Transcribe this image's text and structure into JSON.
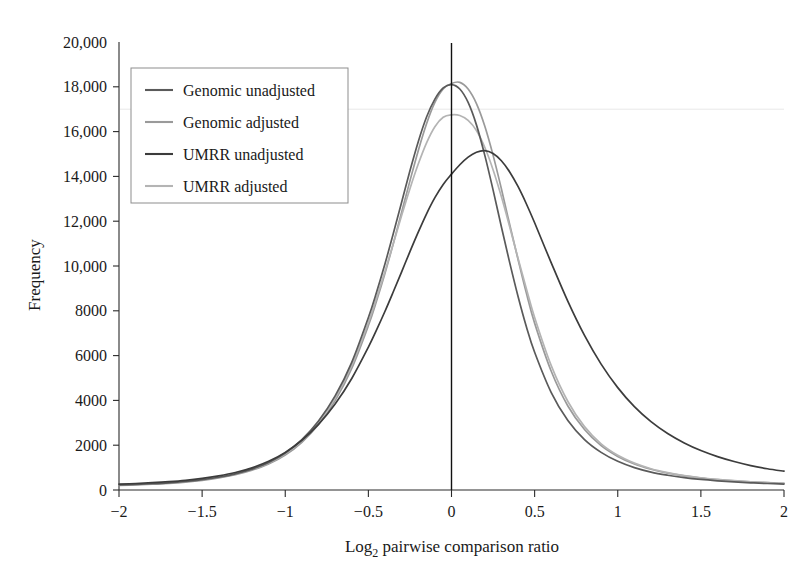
{
  "chart_data": {
    "type": "line",
    "title": "",
    "xlabel": "Log2 pairwise comparison ratio",
    "xlabel_base": "Log",
    "xlabel_sub": "2",
    "xlabel_rest": " pairwise comparison ratio",
    "ylabel": "Frequency",
    "xlim": [
      -2,
      2
    ],
    "ylim": [
      0,
      20000
    ],
    "grid": false,
    "legend_position": "top-left",
    "xticks": [
      -2,
      -1.5,
      -1,
      -0.5,
      0,
      0.5,
      1,
      1.5,
      2
    ],
    "xtick_labels": [
      "−2",
      "−1.5",
      "−1",
      "−0.5",
      "0",
      "0.5",
      "1",
      "1.5",
      "2"
    ],
    "yticks": [
      0,
      2000,
      4000,
      6000,
      8000,
      10000,
      12000,
      14000,
      16000,
      18000,
      20000
    ],
    "ytick_labels": [
      "0",
      "2000",
      "4000",
      "6000",
      "8000",
      "10,000",
      "12,000",
      "14,000",
      "16,000",
      "18,000",
      "20,000"
    ],
    "reference_line_x": 0,
    "x": [
      -2,
      -1.9,
      -1.8,
      -1.7,
      -1.6,
      -1.5,
      -1.4,
      -1.3,
      -1.2,
      -1.1,
      -1,
      -0.9,
      -0.8,
      -0.7,
      -0.6,
      -0.5,
      -0.45,
      -0.4,
      -0.35,
      -0.3,
      -0.25,
      -0.2,
      -0.15,
      -0.1,
      -0.05,
      0,
      0.05,
      0.1,
      0.15,
      0.2,
      0.25,
      0.3,
      0.35,
      0.4,
      0.45,
      0.5,
      0.6,
      0.7,
      0.8,
      0.9,
      1,
      1.1,
      1.2,
      1.3,
      1.4,
      1.5,
      1.6,
      1.7,
      1.8,
      1.9,
      2
    ],
    "series": [
      {
        "name": "Genomic unadjusted",
        "color": "#5a5a5a",
        "peak_x": -0.02,
        "peak_y": 18100,
        "values": [
          230,
          250,
          280,
          320,
          380,
          460,
          570,
          720,
          930,
          1230,
          1650,
          2250,
          3080,
          4200,
          5700,
          7700,
          8850,
          10100,
          11450,
          12850,
          14250,
          15550,
          16650,
          17450,
          17950,
          18100,
          17900,
          17300,
          16300,
          14950,
          13400,
          11750,
          10150,
          8650,
          7300,
          6150,
          4350,
          3100,
          2250,
          1680,
          1280,
          1000,
          800,
          660,
          550,
          470,
          410,
          360,
          320,
          290,
          265
        ]
      },
      {
        "name": "Genomic adjusted",
        "color": "#9a9a9a",
        "peak_x": 0.06,
        "peak_y": 18200,
        "values": [
          210,
          230,
          260,
          300,
          355,
          430,
          535,
          680,
          880,
          1160,
          1560,
          2130,
          2920,
          3990,
          5430,
          7340,
          8460,
          9680,
          11000,
          12400,
          13800,
          15150,
          16350,
          17300,
          17900,
          18150,
          18200,
          17900,
          17250,
          16250,
          14950,
          13450,
          11850,
          10300,
          8800,
          7450,
          5300,
          3750,
          2700,
          1980,
          1500,
          1160,
          925,
          755,
          630,
          535,
          465,
          405,
          360,
          325,
          295
        ]
      },
      {
        "name": "UMRR unadjusted",
        "color": "#3c3c3c",
        "peak_x": 0.2,
        "peak_y": 15150,
        "values": [
          265,
          290,
          325,
          370,
          430,
          515,
          630,
          780,
          990,
          1280,
          1680,
          2220,
          2930,
          3840,
          4980,
          6380,
          7160,
          7980,
          8850,
          9740,
          10640,
          11510,
          12330,
          13050,
          13640,
          14100,
          14520,
          14860,
          15080,
          15150,
          15020,
          14700,
          14200,
          13550,
          12780,
          11930,
          10140,
          8420,
          6900,
          5620,
          4570,
          3720,
          3050,
          2520,
          2100,
          1760,
          1490,
          1270,
          1090,
          950,
          840
        ]
      },
      {
        "name": "UMRR adjusted",
        "color": "#b4b4b4",
        "peak_x": 0.03,
        "peak_y": 16750,
        "values": [
          225,
          245,
          275,
          315,
          372,
          450,
          560,
          710,
          915,
          1205,
          1615,
          2200,
          3010,
          4100,
          5560,
          7480,
          8590,
          9760,
          11000,
          12250,
          13450,
          14550,
          15500,
          16220,
          16640,
          16750,
          16720,
          16500,
          16050,
          15300,
          14300,
          13100,
          11750,
          10350,
          9000,
          7700,
          5550,
          3950,
          2830,
          2060,
          1550,
          1200,
          950,
          775,
          645,
          548,
          475,
          415,
          368,
          332,
          302
        ]
      }
    ]
  },
  "legend": {
    "items": [
      {
        "label": "Genomic unadjusted"
      },
      {
        "label": "Genomic adjusted"
      },
      {
        "label": "UMRR unadjusted"
      },
      {
        "label": "UMRR adjusted"
      }
    ]
  }
}
